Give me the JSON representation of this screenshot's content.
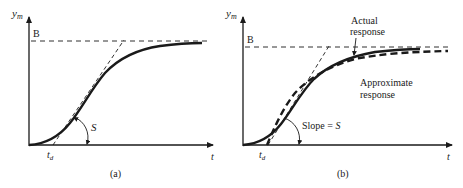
{
  "panel_a": {
    "caption": "(a)",
    "y_axis_label": "y",
    "y_axis_sub": "m",
    "x_axis_label": "t",
    "level_label": "B",
    "delay_label": "t",
    "delay_sub": "d",
    "slope_label": "S"
  },
  "panel_b": {
    "caption": "(b)",
    "y_axis_label": "y",
    "y_axis_sub": "m",
    "x_axis_label": "t",
    "level_label": "B",
    "delay_label": "t",
    "delay_sub": "d",
    "slope_label_prefix": "Slope = ",
    "slope_label_var": "S",
    "actual_label_line1": "Actual",
    "actual_label_line2": "response",
    "approx_label_line1": "Approximate",
    "approx_label_line2": "response"
  },
  "colors": {
    "ink": "#1a1a1a",
    "background": "#ffffff"
  }
}
